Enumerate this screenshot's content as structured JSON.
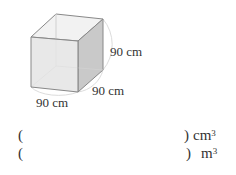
{
  "figure": {
    "shape": "cube",
    "edge_labels": {
      "height": "90 cm",
      "depth": "90 cm",
      "width": "90 cm"
    },
    "colors": {
      "front_face": "#e4e4e4",
      "side_face": "#c9c9c9",
      "top_face": "#f2f2f2",
      "edge": "#888888",
      "hidden_edge": "#cfcfcf"
    }
  },
  "answers": [
    {
      "open": "(",
      "close": ")",
      "unit": "cm",
      "exponent": "3"
    },
    {
      "open": "(",
      "close": ")",
      "unit": "m",
      "exponent": "3"
    }
  ]
}
